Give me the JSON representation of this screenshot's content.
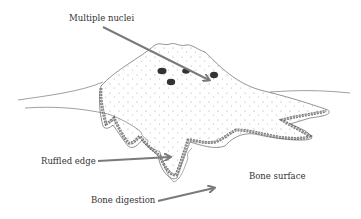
{
  "figure": {
    "labels": [
      {
        "id": "multiple-nuclei",
        "text": "Multiple nuclei"
      },
      {
        "id": "ruffled-edge",
        "text": "Ruffled edge"
      },
      {
        "id": "bone-surface",
        "text": "Bone surface"
      },
      {
        "id": "bone-digestion",
        "text": "Bone digestion"
      }
    ],
    "colors": {
      "arrow": "#7a7a7a",
      "outline": "#555555",
      "nucleus": "#333333",
      "stipple": "#888888"
    }
  }
}
